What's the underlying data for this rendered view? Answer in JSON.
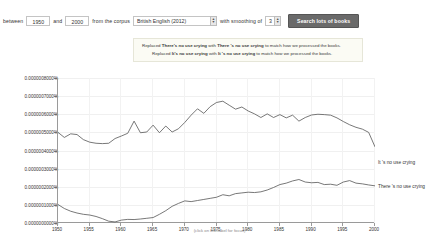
{
  "query_bar": {
    "between_label": "between",
    "start_year": "1950",
    "and_label": "and",
    "end_year": "2000",
    "corpus_label": "from the corpus",
    "corpus_value": "British English (2012)",
    "smoothing_label": "with smoothing of",
    "smoothing_value": "3",
    "search_button": "Search lots of books",
    "up_arrow": "▲",
    "down_arrow": "▼"
  },
  "notice": {
    "line1_pre": "Replaced ",
    "line1_orig": "There's no use crying",
    "line1_mid": " with ",
    "line1_new": "There 's no use crying",
    "line1_post": " to match how we processed the books.",
    "line2_pre": "Replaced ",
    "line2_orig": "It's no use crying",
    "line2_mid": " with ",
    "line2_new": "It 's no use crying",
    "line2_post": " to match how we processed the books."
  },
  "footer": {
    "focus_note": "(click on line/label for focus)"
  },
  "chart_data": {
    "type": "line",
    "title": "",
    "xlabel": "",
    "ylabel": "",
    "xlim": [
      1950,
      2000
    ],
    "ylim": [
      0,
      8e-07
    ],
    "grid": true,
    "legend_position": "right-inline",
    "ytick_labels": [
      "0.0000008000%",
      "0.0000007000%",
      "0.0000006000%",
      "0.0000005000%",
      "0.0000004000%",
      "0.0000003000%",
      "0.0000002000%",
      "0.0000001000%",
      "0.0000000000%"
    ],
    "ytick_values": [
      8e-07,
      7e-07,
      6e-07,
      5e-07,
      4e-07,
      3e-07,
      2e-07,
      1e-07,
      0
    ],
    "xtick_labels": [
      "1950",
      "1955",
      "1960",
      "1965",
      "1970",
      "1975",
      "1980",
      "1985",
      "1990",
      "1995",
      "2000"
    ],
    "xtick_values": [
      1950,
      1955,
      1960,
      1965,
      1970,
      1975,
      1980,
      1985,
      1990,
      1995,
      2000
    ],
    "x": [
      1950,
      1951,
      1952,
      1953,
      1954,
      1955,
      1956,
      1957,
      1958,
      1959,
      1960,
      1961,
      1962,
      1963,
      1964,
      1965,
      1966,
      1967,
      1968,
      1969,
      1970,
      1971,
      1972,
      1973,
      1974,
      1975,
      1976,
      1977,
      1978,
      1979,
      1980,
      1981,
      1982,
      1983,
      1984,
      1985,
      1986,
      1987,
      1988,
      1989,
      1990,
      1991,
      1992,
      1993,
      1994,
      1995,
      1996,
      1997,
      1998,
      1999,
      2000
    ],
    "series": [
      {
        "name": "It 's no use crying",
        "color": "#555555",
        "label_x": 2000,
        "label_y": 3.35e-07,
        "values": [
          5e-07,
          4.72e-07,
          4.92e-07,
          4.88e-07,
          4.6e-07,
          4.46e-07,
          4.4e-07,
          4.38e-07,
          4.4e-07,
          4.66e-07,
          4.8e-07,
          4.95e-07,
          5.62e-07,
          4.98e-07,
          5.02e-07,
          5.4e-07,
          4.98e-07,
          5.35e-07,
          5.02e-07,
          5.2e-07,
          5.55e-07,
          5.95e-07,
          6.3e-07,
          6.05e-07,
          6.42e-07,
          6.65e-07,
          6.72e-07,
          6.5e-07,
          6.28e-07,
          6.4e-07,
          6.18e-07,
          6.02e-07,
          5.82e-07,
          6.02e-07,
          5.82e-07,
          5.98e-07,
          5.8e-07,
          5.95e-07,
          5.62e-07,
          5.82e-07,
          5.96e-07,
          6e-07,
          5.98e-07,
          5.95e-07,
          5.8e-07,
          5.6e-07,
          5.42e-07,
          5.28e-07,
          5.18e-07,
          5e-07,
          4.2e-07
        ],
        "extended_values_tail": [
          3.7e-07,
          3.52e-07,
          3.48e-07,
          3.45e-07,
          3.42e-07,
          3.58e-07,
          3.62e-07,
          3.48e-07,
          3.42e-07,
          3.45e-07
        ]
      },
      {
        "name": "There 's no use crying",
        "color": "#555555",
        "label_x": 2000,
        "label_y": 2.05e-07,
        "values": [
          1.02e-07,
          8e-08,
          6.5e-08,
          5.5e-08,
          4.8e-08,
          4.4e-08,
          3.6e-08,
          2.4e-08,
          1e-08,
          6e-09,
          1.6e-08,
          2e-08,
          1.9e-08,
          2.2e-08,
          2.6e-08,
          3e-08,
          4.8e-08,
          6.8e-08,
          9.2e-08,
          1.08e-07,
          1.22e-07,
          1.18e-07,
          1.24e-07,
          1.3e-07,
          1.36e-07,
          1.42e-07,
          1.56e-07,
          1.5e-07,
          1.62e-07,
          1.66e-07,
          1.7e-07,
          1.68e-07,
          1.72e-07,
          1.82e-07,
          1.96e-07,
          2.12e-07,
          2.2e-07,
          2.32e-07,
          2.4e-07,
          2.26e-07,
          2.22e-07,
          2.24e-07,
          2.12e-07,
          2.14e-07,
          2.08e-07,
          2.26e-07,
          2.34e-07,
          2.2e-07,
          2.16e-07,
          2.1e-07,
          2.05e-07
        ]
      }
    ]
  }
}
